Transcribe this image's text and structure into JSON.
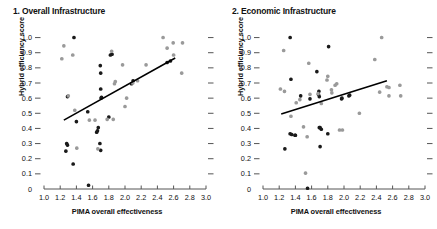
{
  "figure": {
    "background": "#ffffff",
    "width": 437,
    "height": 229
  },
  "panels": [
    {
      "title": "1. Overall Infrastructure",
      "xlabel": "PIMA overall effectiveness",
      "ylabel": "Hybrid efficiency score"
    },
    {
      "title": "2. Economic Infrastructure",
      "xlabel": "PIMA overall effectiveness",
      "ylabel": "Hybrid efficiency score"
    }
  ],
  "colors": {
    "dark_point": "#1a1a1a",
    "light_point": "#9a9a9a",
    "trendline": "#000000",
    "axis": "#555555",
    "text": "#111111"
  },
  "chart_data": [
    {
      "type": "scatter",
      "title": "1. Overall Infrastructure",
      "xlabel": "PIMA overall effectiveness",
      "ylabel": "Hybrid efficiency score",
      "xlim": [
        1.0,
        3.0
      ],
      "ylim": [
        0.0,
        1.05
      ],
      "xticks": [
        "1.0",
        "1.2",
        "1.4",
        "1.6",
        "1.8",
        "2.0",
        "2.2",
        "2.4",
        "2.6",
        "2.8",
        "3.0"
      ],
      "xtick_values": [
        1.0,
        1.2,
        1.4,
        1.6,
        1.8,
        2.0,
        2.2,
        2.4,
        2.6,
        2.8,
        3.0
      ],
      "yticks": [
        "0",
        "0.1",
        "0.2",
        "0.3",
        "0.4",
        "0.5",
        "0.6",
        "0.7",
        "0.8",
        "0.9",
        "1.0"
      ],
      "ytick_values": [
        0.0,
        0.1,
        0.2,
        0.3,
        0.4,
        0.5,
        0.6,
        0.7,
        0.8,
        0.9,
        1.0
      ],
      "grid": false,
      "legend": "none",
      "right_ticks_mirrored": true,
      "series": [
        {
          "name": "dark-points",
          "color": "#1a1a1a",
          "points": [
            [
              1.37,
              1.0
            ],
            [
              1.29,
              0.61
            ],
            [
              1.27,
              0.25
            ],
            [
              1.28,
              0.3
            ],
            [
              1.29,
              0.29
            ],
            [
              1.36,
              0.165
            ],
            [
              1.4,
              0.445
            ],
            [
              1.54,
              0.51
            ],
            [
              1.55,
              0.025
            ],
            [
              1.65,
              0.375
            ],
            [
              1.66,
              0.385
            ],
            [
              1.67,
              0.405
            ],
            [
              1.69,
              0.3
            ],
            [
              1.7,
              0.255
            ],
            [
              1.705,
              0.6
            ],
            [
              1.71,
              0.605
            ],
            [
              1.7,
              0.66
            ],
            [
              1.7,
              0.765
            ],
            [
              1.695,
              0.815
            ],
            [
              1.8,
              0.475
            ],
            [
              1.82,
              0.885
            ],
            [
              1.84,
              0.89
            ],
            [
              2.08,
              0.695
            ],
            [
              2.1,
              0.715
            ],
            [
              2.52,
              0.835
            ],
            [
              2.56,
              0.845
            ]
          ]
        },
        {
          "name": "light-points",
          "color": "#9a9a9a",
          "points": [
            [
              1.22,
              0.86
            ],
            [
              1.245,
              0.945
            ],
            [
              1.3,
              0.615
            ],
            [
              1.355,
              0.885
            ],
            [
              1.38,
              0.52
            ],
            [
              1.405,
              0.27
            ],
            [
              1.56,
              0.455
            ],
            [
              1.63,
              0.455
            ],
            [
              1.665,
              0.265
            ],
            [
              1.78,
              0.46
            ],
            [
              1.835,
              0.91
            ],
            [
              1.855,
              0.46
            ],
            [
              1.87,
              0.695
            ],
            [
              1.88,
              0.71
            ],
            [
              1.97,
              0.82
            ],
            [
              2.0,
              0.545
            ],
            [
              2.02,
              0.6
            ],
            [
              2.095,
              0.7
            ],
            [
              2.155,
              0.715
            ],
            [
              2.26,
              0.82
            ],
            [
              2.47,
              1.0
            ],
            [
              2.52,
              0.93
            ],
            [
              2.595,
              0.965
            ],
            [
              2.6,
              0.885
            ],
            [
              2.71,
              0.965
            ],
            [
              2.7,
              0.765
            ]
          ]
        }
      ],
      "trendline": {
        "x0": 1.245,
        "y0": 0.455,
        "x1": 2.62,
        "y1": 0.865,
        "color": "#000000",
        "width": 1.6
      }
    },
    {
      "type": "scatter",
      "title": "2. Economic Infrastructure",
      "xlabel": "PIMA overall effectiveness",
      "ylabel": "Hybrid efficiency score",
      "xlim": [
        1.0,
        3.0
      ],
      "ylim": [
        0.0,
        1.05
      ],
      "xticks": [
        "1.0",
        "1.2",
        "1.4",
        "1.6",
        "1.8",
        "2.0",
        "2.2",
        "2.4",
        "2.6",
        "2.8",
        "3.0"
      ],
      "xtick_values": [
        1.0,
        1.2,
        1.4,
        1.6,
        1.8,
        2.0,
        2.2,
        2.4,
        2.6,
        2.8,
        3.0
      ],
      "yticks": [
        "0",
        "0.1",
        "0.2",
        "0.3",
        "0.4",
        "0.5",
        "0.6",
        "0.7",
        "0.8",
        "0.9",
        "1.0"
      ],
      "ytick_values": [
        0.0,
        0.1,
        0.2,
        0.3,
        0.4,
        0.5,
        0.6,
        0.7,
        0.8,
        0.9,
        1.0
      ],
      "grid": false,
      "legend": "none",
      "right_ticks_mirrored": true,
      "series": [
        {
          "name": "dark-points",
          "color": "#1a1a1a",
          "points": [
            [
              1.27,
              0.265
            ],
            [
              1.335,
              1.0
            ],
            [
              1.345,
              0.725
            ],
            [
              1.335,
              0.365
            ],
            [
              1.355,
              0.36
            ],
            [
              1.395,
              0.355
            ],
            [
              1.4,
              0.355
            ],
            [
              1.465,
              0.615
            ],
            [
              1.55,
              0.005
            ],
            [
              1.58,
              0.595
            ],
            [
              1.665,
              0.775
            ],
            [
              1.685,
              0.625
            ],
            [
              1.69,
              0.645
            ],
            [
              1.695,
              0.61
            ],
            [
              1.695,
              0.405
            ],
            [
              1.705,
              0.405
            ],
            [
              1.72,
              0.395
            ],
            [
              1.705,
              0.28
            ],
            [
              1.8,
              0.365
            ],
            [
              1.81,
              0.94
            ],
            [
              1.97,
              0.595
            ],
            [
              1.975,
              0.6
            ],
            [
              2.06,
              0.615
            ],
            [
              2.07,
              0.62
            ]
          ]
        },
        {
          "name": "light-points",
          "color": "#9a9a9a",
          "points": [
            [
              1.215,
              0.66
            ],
            [
              1.255,
              0.915
            ],
            [
              1.265,
              0.645
            ],
            [
              1.345,
              0.48
            ],
            [
              1.41,
              0.57
            ],
            [
              1.455,
              0.59
            ],
            [
              1.5,
              0.41
            ],
            [
              1.525,
              0.105
            ],
            [
              1.545,
              0.345
            ],
            [
              1.565,
              0.83
            ],
            [
              1.58,
              0.625
            ],
            [
              1.68,
              0.63
            ],
            [
              1.72,
              0.565
            ],
            [
              1.79,
              0.72
            ],
            [
              1.8,
              0.745
            ],
            [
              1.845,
              0.655
            ],
            [
              1.85,
              0.635
            ],
            [
              1.89,
              0.685
            ],
            [
              1.91,
              0.695
            ],
            [
              1.945,
              0.39
            ],
            [
              1.98,
              0.39
            ],
            [
              2.19,
              0.5
            ],
            [
              2.38,
              0.855
            ],
            [
              2.44,
              0.64
            ],
            [
              2.465,
              1.0
            ],
            [
              2.53,
              0.675
            ],
            [
              2.555,
              0.67
            ],
            [
              2.555,
              0.615
            ],
            [
              2.69,
              0.685
            ],
            [
              2.7,
              0.615
            ]
          ]
        }
      ],
      "trendline": {
        "x0": 1.225,
        "y0": 0.495,
        "x1": 2.53,
        "y1": 0.715,
        "color": "#000000",
        "width": 1.6
      }
    }
  ]
}
